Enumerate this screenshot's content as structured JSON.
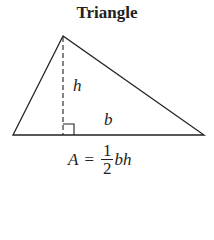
{
  "title": "Triangle",
  "labels": {
    "height": "h",
    "base": "b"
  },
  "formula": {
    "lhs": "A",
    "eq": "=",
    "num": "1",
    "den": "2",
    "rhs": "bh"
  }
}
